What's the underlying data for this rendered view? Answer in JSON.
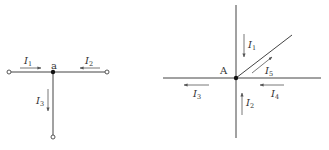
{
  "diagram_left": {
    "node_label": "a",
    "currents": [
      {
        "name": "I",
        "sub": "1",
        "direction": "right"
      },
      {
        "name": "I",
        "sub": "2",
        "direction": "left"
      },
      {
        "name": "I",
        "sub": "3",
        "direction": "down"
      }
    ]
  },
  "diagram_right": {
    "node_label": "A",
    "currents": [
      {
        "name": "I",
        "sub": "1",
        "direction": "down"
      },
      {
        "name": "I",
        "sub": "2",
        "direction": "up"
      },
      {
        "name": "I",
        "sub": "3",
        "direction": "left"
      },
      {
        "name": "I",
        "sub": "4",
        "direction": "left"
      },
      {
        "name": "I",
        "sub": "5",
        "direction": "up-right"
      }
    ]
  }
}
